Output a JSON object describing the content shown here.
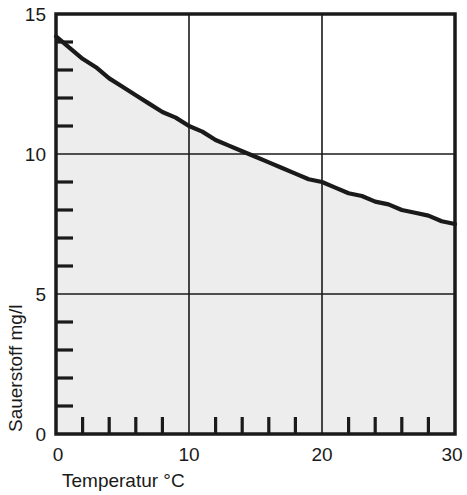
{
  "chart_data": {
    "type": "line",
    "title": "",
    "subtitle": "",
    "xlabel": "Temperatur °C",
    "ylabel": "Sauerstoff mg/l",
    "xlim": [
      0,
      30
    ],
    "ylim": [
      0,
      15
    ],
    "x_major_ticks": [
      0,
      10,
      20,
      30
    ],
    "x_major_tick_labels": [
      "0",
      "10",
      "20",
      "30"
    ],
    "x_minor_tick_step": 2,
    "y_major_ticks": [
      0,
      5,
      10,
      15
    ],
    "y_major_tick_labels": [
      "0",
      "5",
      "10",
      "15"
    ],
    "y_minor_tick_step": 1,
    "grid": "major gridlines at x=10,20 and y=5,10",
    "legend": "none",
    "fill_under_curve": true,
    "fill_color": "#ededed",
    "line_color": "#1a1a1a",
    "axis_color": "#1a1a1a",
    "background_color": "#ffffff",
    "series": [
      {
        "name": "Sauerstoffsättigung",
        "x": [
          0,
          1,
          2,
          3,
          4,
          5,
          6,
          7,
          8,
          9,
          10,
          11,
          12,
          13,
          14,
          15,
          16,
          17,
          18,
          19,
          20,
          21,
          22,
          23,
          24,
          25,
          26,
          27,
          28,
          29,
          30
        ],
        "values": [
          14.2,
          13.8,
          13.4,
          13.1,
          12.7,
          12.4,
          12.1,
          11.8,
          11.5,
          11.3,
          11.0,
          10.8,
          10.5,
          10.3,
          10.1,
          9.9,
          9.7,
          9.5,
          9.3,
          9.1,
          9.0,
          8.8,
          8.6,
          8.5,
          8.3,
          8.2,
          8.0,
          7.9,
          7.8,
          7.6,
          7.5
        ]
      }
    ],
    "annotations": []
  },
  "axes": {
    "x_labels": [
      "0",
      "10",
      "20",
      "30"
    ],
    "y_labels": [
      "15",
      "10",
      "5",
      "0"
    ],
    "x_title": "Temperatur °C",
    "y_title": "Sauerstoff mg/l"
  }
}
